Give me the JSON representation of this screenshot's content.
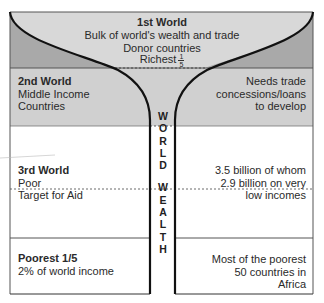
{
  "colors": {
    "first_world_inner": "#d8d8d8",
    "first_world_outer": "#a9a9a9",
    "second_world": "#d0d0d0",
    "lower_bands": "#ffffff",
    "funnel_stroke": "#111111",
    "frame_stroke": "#444444"
  },
  "first_world": {
    "title": "1st World",
    "line1": "Bulk of world's wealth and trade",
    "line2": "Donor countries",
    "line3": "Richest",
    "fraction_num": "1",
    "fraction_den": "5"
  },
  "second_world": {
    "title": "2nd World",
    "left_line1": "Middle Income",
    "left_line2": "Countries",
    "right_line1": "Needs trade",
    "right_line2": "concessions/loans",
    "right_line3": "to develop"
  },
  "third_world": {
    "title": "3rd World",
    "left_line1": "Poor",
    "left_line2": "Target for Aid",
    "right_line1": "3.5 billion of whom",
    "right_line2": "2.9 billion on very",
    "right_line3": "low incomes"
  },
  "poorest": {
    "title": "Poorest 1/5",
    "left_line1": "2% of world income",
    "right_line1": "Most of the poorest",
    "right_line2": "50 countries in",
    "right_line3": "Africa"
  },
  "stem": {
    "letters": [
      "W",
      "O",
      "R",
      "L",
      "D",
      "",
      "W",
      "E",
      "A",
      "L",
      "T",
      "H"
    ]
  }
}
